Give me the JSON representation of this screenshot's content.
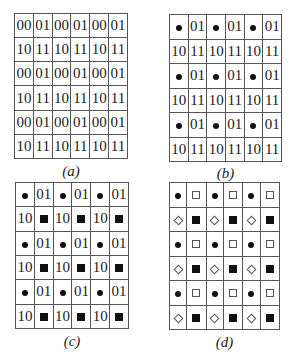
{
  "panels": [
    {
      "id": "a",
      "caption": "(a)",
      "rows": [
        [
          "00",
          "01",
          "00",
          "01",
          "00",
          "01"
        ],
        [
          "10",
          "11",
          "10",
          "11",
          "10",
          "11"
        ],
        [
          "00",
          "01",
          "00",
          "01",
          "00",
          "01"
        ],
        [
          "10",
          "11",
          "10",
          "11",
          "10",
          "11"
        ],
        [
          "00",
          "01",
          "00",
          "01",
          "00",
          "01"
        ],
        [
          "10",
          "11",
          "10",
          "11",
          "10",
          "11"
        ]
      ]
    },
    {
      "id": "b",
      "caption": "(b)",
      "rows": [
        [
          "dot",
          "01",
          "dot",
          "01",
          "dot",
          "01"
        ],
        [
          "10",
          "11",
          "10",
          "11",
          "10",
          "11"
        ],
        [
          "dot",
          "01",
          "dot",
          "01",
          "dot",
          "01"
        ],
        [
          "10",
          "11",
          "10",
          "11",
          "10",
          "11"
        ],
        [
          "dot",
          "01",
          "dot",
          "01",
          "dot",
          "01"
        ],
        [
          "10",
          "11",
          "10",
          "11",
          "10",
          "11"
        ]
      ]
    },
    {
      "id": "c",
      "caption": "(c)",
      "rows": [
        [
          "dot",
          "01",
          "dot",
          "01",
          "dot",
          "01"
        ],
        [
          "10",
          "filled-square",
          "10",
          "filled-square",
          "10",
          "filled-square"
        ],
        [
          "dot",
          "01",
          "dot",
          "01",
          "dot",
          "01"
        ],
        [
          "10",
          "filled-square",
          "10",
          "filled-square",
          "10",
          "filled-square"
        ],
        [
          "dot",
          "01",
          "dot",
          "01",
          "dot",
          "01"
        ],
        [
          "10",
          "filled-square",
          "10",
          "filled-square",
          "10",
          "filled-square"
        ]
      ]
    },
    {
      "id": "d",
      "caption": "(d)",
      "rows": [
        [
          "dot",
          "open-square",
          "dot",
          "open-square",
          "dot",
          "open-square"
        ],
        [
          "open-diamond",
          "filled-square",
          "open-diamond",
          "filled-square",
          "open-diamond",
          "filled-square"
        ],
        [
          "dot",
          "open-square",
          "dot",
          "open-square",
          "dot",
          "open-square"
        ],
        [
          "open-diamond",
          "filled-square",
          "open-diamond",
          "filled-square",
          "open-diamond",
          "filled-square"
        ],
        [
          "dot",
          "open-square",
          "dot",
          "open-square",
          "dot",
          "open-square"
        ],
        [
          "open-diamond",
          "filled-square",
          "open-diamond",
          "filled-square",
          "open-diamond",
          "filled-square"
        ]
      ]
    }
  ],
  "layout": [
    {
      "left": 14,
      "top": 13,
      "width": 114,
      "height": 146,
      "capLeft": 14,
      "capTop": 163
    },
    {
      "left": 169,
      "top": 14,
      "width": 113,
      "height": 148,
      "capLeft": 169,
      "capTop": 165
    },
    {
      "left": 15,
      "top": 182,
      "width": 114,
      "height": 147,
      "capLeft": 15,
      "capTop": 333
    },
    {
      "left": 169,
      "top": 182,
      "width": 111,
      "height": 148,
      "capLeft": 169,
      "capTop": 334
    }
  ]
}
